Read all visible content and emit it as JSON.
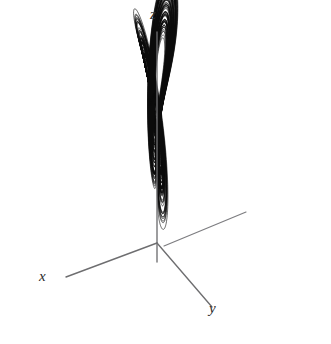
{
  "figure": {
    "background_color": "#ffffff",
    "ink_color": "#0b0b0b",
    "axis_color": "#6e6e70",
    "width": 331,
    "height": 344
  },
  "axes": {
    "z": {
      "label": "z",
      "label_x": 155,
      "label_y": 20,
      "line": {
        "x1": 157,
        "y1": 32,
        "x2": 157,
        "y2": 262
      }
    },
    "x": {
      "label": "x",
      "label_x": 44,
      "label_y": 282,
      "line": {
        "x1": 66,
        "y1": 277,
        "x2": 157,
        "y2": 243
      }
    },
    "y": {
      "label": "y",
      "label_x": 214,
      "label_y": 314,
      "line": {
        "x1": 157,
        "y1": 243,
        "x2": 212,
        "y2": 307
      }
    },
    "origin": {
      "x": 157,
      "y": 243
    }
  },
  "tail_segment": {
    "x1": 164,
    "y1": 246,
    "x2": 246,
    "y2": 212
  },
  "holes": [
    {
      "name": "left-lobe-core",
      "cx": 103,
      "cy": 128,
      "rx": 5.6,
      "ry": 6.8,
      "rotation": -18
    },
    {
      "name": "right-lobe-core",
      "cx": 209,
      "cy": 154,
      "rx": 13.5,
      "ry": 8.6,
      "rotation": -14
    }
  ],
  "chart_data": {
    "type": "line",
    "subtitle": "",
    "xlabel": "x",
    "ylabel": "y",
    "zlabel": "z",
    "projection": "3d-oblique",
    "grid": false,
    "legend": null,
    "axis_labels": [
      "x",
      "y",
      "z"
    ],
    "system": "lorenz",
    "equations": [
      "dx/dt = sigma * (y - x)",
      "dy/dt = x * (rho - z) - y",
      "dz/dt = x * y - beta * z"
    ],
    "parameters": {
      "sigma": 10,
      "rho": 28,
      "beta": 2.6666667
    },
    "initial_state": {
      "x": 0.8,
      "y": 0.5,
      "z": 12.0
    },
    "integration": {
      "method": "rk4",
      "dt": 0.0045,
      "steps": 26000,
      "skip": 260
    },
    "projection_matrix": {
      "note": "screen = origin + x*ex + y*ey + z*ez  (pixels per unit)",
      "ex": [
        -1.78,
        0.69
      ],
      "ey": [
        1.48,
        1.72
      ],
      "ez": [
        0.0,
        -5.62
      ]
    },
    "axis_extent_units": {
      "x": 51,
      "y": 37,
      "z": 37.5
    },
    "lobe_centers_units": [
      {
        "x": -8.43,
        "y": -8.43,
        "z": 27
      },
      {
        "x": 8.43,
        "y": 8.43,
        "z": 27
      }
    ],
    "xlim": [
      -20,
      20
    ],
    "ylim": [
      -28,
      28
    ],
    "zlim": [
      0,
      50
    ]
  }
}
